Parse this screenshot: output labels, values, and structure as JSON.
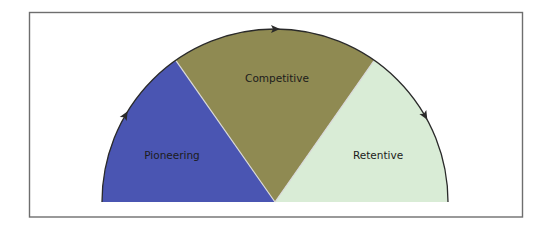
{
  "diagram": {
    "type": "semicircle-cycle",
    "segments": [
      {
        "label": "Pioneering",
        "color": "#4a55b2",
        "start_deg": 180,
        "end_deg": 125
      },
      {
        "label": "Competitive",
        "color": "#8f8a52",
        "start_deg": 125,
        "end_deg": 55
      },
      {
        "label": "Retentive",
        "color": "#d9ecd6",
        "start_deg": 55,
        "end_deg": 0
      }
    ],
    "arc_stroke_color": "#2a2a2a",
    "arrows": [
      {
        "name": "arrow-left",
        "direction": "clockwise",
        "deg": 150
      },
      {
        "name": "arrow-top",
        "direction": "clockwise",
        "deg": 90
      },
      {
        "name": "arrow-right",
        "direction": "clockwise",
        "deg": 30
      }
    ],
    "frame_color": "#6e6e6e"
  }
}
